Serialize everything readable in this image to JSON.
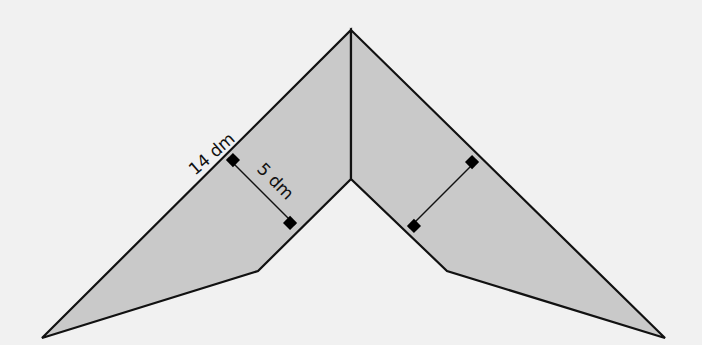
{
  "figure": {
    "background": "#f1f1f1",
    "fill_color": "#c9c9c9",
    "stroke_color": "#111111",
    "labels": {
      "side_length": "14 dm",
      "height": "5 dm"
    },
    "shape": {
      "description": "Chevron-shaped polygon split by a vertical line into two congruent quadrilaterals, each with a perpendicular height marked",
      "vertices": {
        "top": [
          351,
          30
        ],
        "inner": [
          351,
          179
        ],
        "left_bend": [
          258,
          271
        ],
        "left_tip": [
          42,
          338
        ],
        "right_bend": [
          447,
          271
        ],
        "right_tip": [
          665,
          338
        ]
      }
    },
    "perpendiculars": [
      {
        "from": [
          228,
          158
        ],
        "to": [
          295,
          225
        ]
      },
      {
        "from": [
          477,
          160
        ],
        "to": [
          409,
          228
        ]
      }
    ]
  }
}
